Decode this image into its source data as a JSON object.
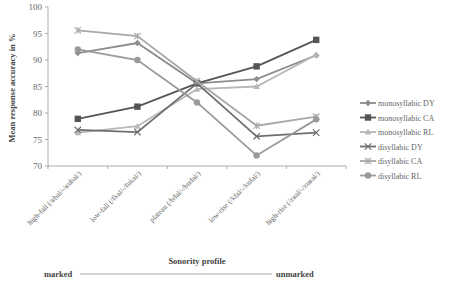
{
  "chart_data": {
    "type": "line",
    "title": "",
    "xlabel": "Sonority profile",
    "ylabel": "Mean response accuracy in %",
    "ylim": [
      70,
      100
    ],
    "yticks": [
      70,
      75,
      80,
      85,
      90,
      95,
      100
    ],
    "grid": false,
    "legend_position": "right",
    "categories": [
      "high-fall (/ʁbal/-/ʁubal/)",
      "low-fall (/fkal/-/fukal/)",
      "plateau (/bdal/-/budal/)",
      "low-rise (/kfal/-/kufal/)",
      "high-rise (/zʁal/-/zuʁal/)"
    ],
    "series": [
      {
        "name": "monosyllabic DY",
        "marker": "diamond",
        "color": "#8c8c8c",
        "values": [
          91.3,
          93.2,
          85.6,
          86.4,
          90.9
        ]
      },
      {
        "name": "monosyllabic CA",
        "marker": "square",
        "color": "#555555",
        "values": [
          78.9,
          81.2,
          85.6,
          88.8,
          93.8
        ]
      },
      {
        "name": "monosyllabic RL",
        "marker": "triangle",
        "color": "#b8b8b8",
        "values": [
          76.3,
          77.5,
          84.5,
          85.0,
          91.0
        ]
      },
      {
        "name": "disyllabic DY",
        "marker": "x",
        "color": "#6e6e6e",
        "values": [
          76.8,
          76.4,
          85.6,
          75.6,
          76.3
        ]
      },
      {
        "name": "disyllabic CA",
        "marker": "star",
        "color": "#a8a8a8",
        "values": [
          95.6,
          94.5,
          86.0,
          77.6,
          79.3
        ]
      },
      {
        "name": "disyllabic RL",
        "marker": "circle",
        "color": "#9a9a9a",
        "values": [
          92.0,
          90.0,
          82.0,
          72.0,
          78.8
        ]
      }
    ],
    "annotations": {
      "left_end": "marked",
      "right_end": "unmarked"
    }
  }
}
